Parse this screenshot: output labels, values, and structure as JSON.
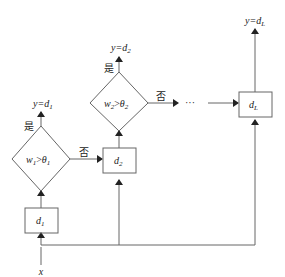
{
  "diagram": {
    "input": "x",
    "yes_label": "是",
    "no_label": "否",
    "ellipsis": "···",
    "nodes": {
      "d1": {
        "main": "d",
        "sub": "1"
      },
      "d2": {
        "main": "d",
        "sub": "2"
      },
      "dL": {
        "main": "d",
        "sub": "L"
      },
      "cond1": {
        "w": "w",
        "wsub": "1",
        "op": ">",
        "t": "θ",
        "tsub": "1"
      },
      "cond2": {
        "w": "w",
        "wsub": "2",
        "op": ">",
        "t": "θ",
        "tsub": "2"
      }
    },
    "outputs": {
      "out1": {
        "y": "y=d",
        "sub": "1"
      },
      "out2": {
        "y": "y=d",
        "sub": "2"
      },
      "outL": {
        "y": "y=d",
        "sub": "L"
      }
    }
  }
}
